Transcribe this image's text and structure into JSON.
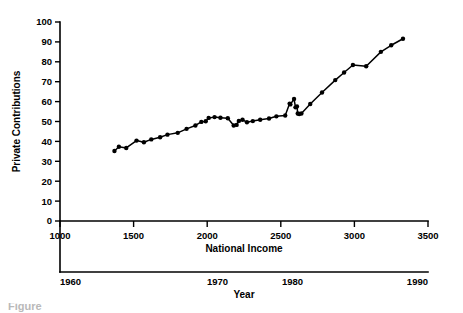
{
  "chart_data": {
    "type": "line",
    "title": "",
    "xlabel": "National Income",
    "ylabel": "Private Contributions",
    "secondary_xlabel": "Year",
    "xlim": [
      1000,
      3500
    ],
    "ylim": [
      0,
      100
    ],
    "grid": false,
    "legend": "none",
    "marker": "filled-circle",
    "x_ticks": [
      1000,
      1500,
      2000,
      2500,
      3000,
      3500
    ],
    "x_tick_labels": [
      "1000",
      "1500",
      "2000",
      "2500",
      "3000",
      "3500"
    ],
    "y_ticks": [
      0,
      10,
      20,
      30,
      40,
      50,
      60,
      70,
      80,
      90,
      100
    ],
    "y_tick_labels": [
      "0",
      "10",
      "20",
      "30",
      "40",
      "50",
      "60",
      "70",
      "80",
      "90",
      "100"
    ],
    "secondary_x_ticks": [
      1960,
      1970,
      1980,
      1990
    ],
    "secondary_x_tick_labels": [
      "1960",
      "1970",
      "1980",
      "1990"
    ],
    "secondary_x_tick_positions": [
      1000,
      2070,
      2580,
      3500
    ],
    "x": [
      1370,
      1400,
      1450,
      1520,
      1570,
      1620,
      1680,
      1730,
      1800,
      1860,
      1920,
      1960,
      1990,
      2010,
      2050,
      2090,
      2140,
      2180,
      2200,
      2215,
      2240,
      2270,
      2310,
      2360,
      2420,
      2470,
      2530,
      2560,
      2565,
      2590,
      2600,
      2610,
      2615,
      2625,
      2640,
      2700,
      2780,
      2870,
      2930,
      2990,
      3080,
      3180,
      3250,
      3330
    ],
    "y": [
      35.2,
      37.3,
      36.7,
      40.4,
      39.6,
      41.0,
      42.1,
      43.4,
      44.3,
      46.3,
      48.0,
      49.8,
      50.1,
      51.8,
      52.2,
      51.9,
      51.6,
      48.0,
      48.3,
      50.3,
      50.9,
      49.6,
      50.2,
      50.9,
      51.5,
      52.6,
      53.0,
      59.0,
      58.6,
      61.3,
      57.1,
      57.6,
      54.0,
      53.8,
      54.0,
      58.8,
      64.6,
      70.8,
      74.6,
      78.4,
      77.8,
      85.0,
      88.3,
      91.6
    ],
    "series_name": "Private Contributions vs National Income"
  },
  "axes": {
    "y_axis_title": "Private Contributions",
    "x_axis_title": "National Income",
    "secondary_axis_title": "Year"
  },
  "caption": {
    "text": "Figure"
  }
}
